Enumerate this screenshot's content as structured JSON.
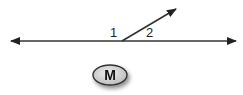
{
  "diagram": {
    "type": "angle-pair",
    "line": {
      "label": "horizontal line with arrows at both ends"
    },
    "ray": {
      "label": "ray from line upward to the right"
    },
    "angle_labels": [
      "1",
      "2"
    ],
    "badge": {
      "text": "M"
    },
    "colors": {
      "stroke": "#222222",
      "oval_fill": "#d6d6d6",
      "oval_stroke": "#333333"
    }
  }
}
